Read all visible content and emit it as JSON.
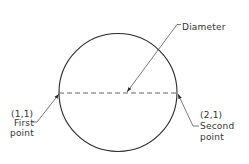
{
  "diagram": {
    "type": "circle-two-point-diameter",
    "colors": {
      "stroke": "#2a2a2a",
      "text": "#333333",
      "background": "#ffffff"
    },
    "circle": {
      "cx": 118,
      "cy": 92.5,
      "r": 59
    },
    "diameter_line": {
      "style": "dashed",
      "x1": 59,
      "y1": 93,
      "x2": 177,
      "y2": 93
    },
    "labels": {
      "diameter": "Diameter",
      "first_coord": "(1,1)",
      "first_line1": "First",
      "first_line2": "point",
      "second_coord": "(2,1)",
      "second_line1": "Second",
      "second_line2": "point"
    }
  }
}
